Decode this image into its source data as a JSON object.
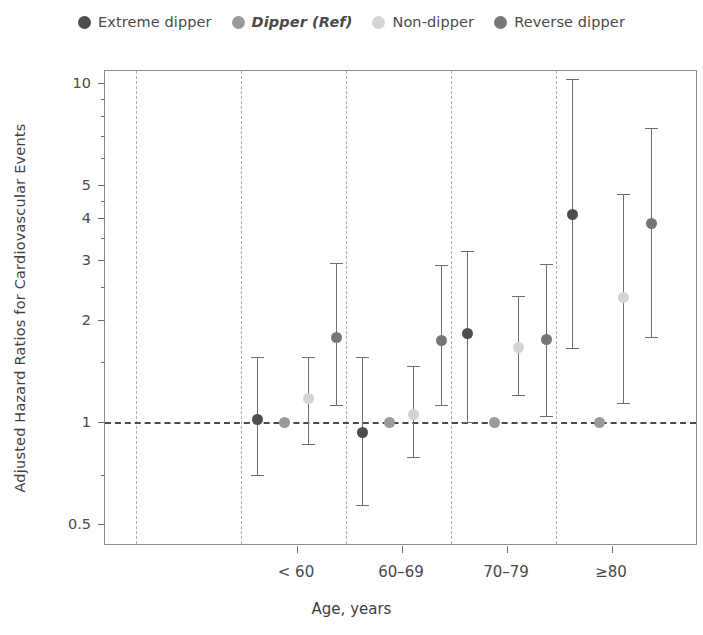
{
  "legend": {
    "items": [
      {
        "label": "Extreme dipper",
        "color": "#4d4d4d",
        "italic": false,
        "icon": "circle-marker-icon"
      },
      {
        "label": "Dipper (Ref)",
        "color": "#9a9a9a",
        "italic": true,
        "icon": "circle-marker-icon"
      },
      {
        "label": "Non-dipper",
        "color": "#d4d4d4",
        "italic": false,
        "icon": "circle-marker-icon"
      },
      {
        "label": "Reverse dipper",
        "color": "#767676",
        "italic": false,
        "icon": "circle-marker-icon"
      }
    ]
  },
  "axes": {
    "y_title": "Adjusted Hazard Ratios for Cardiovascular Events",
    "x_title": "Age, years",
    "y_ticks": [
      "10",
      "5",
      "4",
      "3",
      "2",
      "1",
      "0.5"
    ],
    "x_ticks": [
      "< 60",
      "60–69",
      "70–79",
      "≥80"
    ]
  },
  "chart_data": {
    "type": "scatter",
    "title": "",
    "xlabel": "Age, years",
    "ylabel": "Adjusted Hazard Ratios for Cardiovascular Events",
    "yscale": "log",
    "ylim": [
      0.45,
      11
    ],
    "ytick_values": [
      10,
      5,
      4,
      3,
      2,
      1,
      0.5
    ],
    "reference_line": 1,
    "grid": "vertical-dashed-group-separators",
    "legend_position": "top-center",
    "categories": [
      "< 60",
      "60–69",
      "70–79",
      "≥80"
    ],
    "series": [
      {
        "name": "Extreme dipper",
        "color": "#4d4d4d",
        "values": [
          1.02,
          0.93,
          1.82,
          4.1
        ],
        "ci_low": [
          0.7,
          0.57,
          1.0,
          1.65
        ],
        "ci_high": [
          1.55,
          1.56,
          3.2,
          10.3
        ]
      },
      {
        "name": "Dipper (Ref)",
        "color": "#9a9a9a",
        "values": [
          1.0,
          1.0,
          1.0,
          1.0
        ],
        "ci_low": [
          1.0,
          1.0,
          1.0,
          1.0
        ],
        "ci_high": [
          1.0,
          1.0,
          1.0,
          1.0
        ]
      },
      {
        "name": "Non-dipper",
        "color": "#d4d4d4",
        "values": [
          1.17,
          1.05,
          1.66,
          2.33
        ],
        "ci_low": [
          0.86,
          0.79,
          1.2,
          1.14
        ],
        "ci_high": [
          1.55,
          1.46,
          2.35,
          4.7
        ]
      },
      {
        "name": "Reverse dipper",
        "color": "#767676",
        "values": [
          1.78,
          1.74,
          1.75,
          3.86
        ],
        "ci_low": [
          1.12,
          1.12,
          1.04,
          1.78
        ],
        "ci_high": [
          2.94,
          2.9,
          2.93,
          7.35
        ]
      }
    ]
  },
  "geometry": {
    "plot": {
      "left": 104,
      "top": 70,
      "width": 593,
      "height": 475
    },
    "y_map": {
      "ref_value": 10,
      "ref_px": 12,
      "px_per_decade": 339
    },
    "group_centers_px": [
      192,
      297,
      402,
      507
    ],
    "series_offsets_px": [
      -40,
      -13,
      11,
      39
    ],
    "separators_px": [
      31,
      136,
      241,
      346,
      451
    ],
    "minor_ticks": [
      9,
      8,
      7,
      6,
      4.5,
      3.5,
      2.5,
      1.5,
      0.7
    ]
  }
}
